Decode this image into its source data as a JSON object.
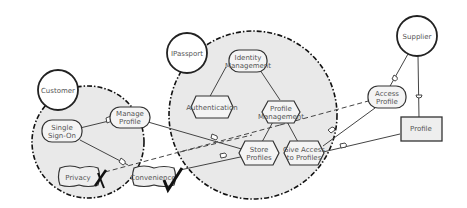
{
  "diagram": {
    "type": "i* strategic rationale model",
    "actors": [
      {
        "id": "customer",
        "label": "Customer"
      },
      {
        "id": "ipassport",
        "label": "IPassport"
      },
      {
        "id": "supplier",
        "label": "Supplier"
      }
    ],
    "customer_elements": {
      "single_sign_on": [
        "Single",
        "Sign-On"
      ],
      "manage_profile": [
        "Manage",
        "Profile"
      ],
      "privacy": "Privacy",
      "convenience": "Convenience"
    },
    "ipassport_elements": {
      "identity_management": [
        "Identity",
        "Management"
      ],
      "authentication": "Authentication",
      "profile_management": [
        "Profile",
        "Management"
      ],
      "store_profiles": [
        "Store",
        "Profiles"
      ],
      "give_access": [
        "Give Access",
        "to Profiles"
      ]
    },
    "supplier_elements": {
      "access_profile": [
        "Access",
        "Profile"
      ],
      "profile": "Profile"
    },
    "evaluations": {
      "privacy": "denied-cross",
      "convenience": "satisfied-check"
    }
  }
}
